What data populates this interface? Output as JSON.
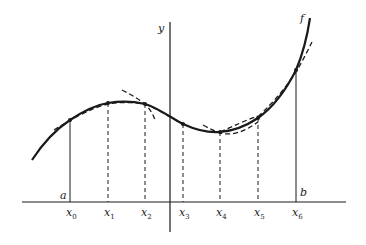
{
  "diagram": {
    "axis_labels": {
      "y": "y"
    },
    "curve_label": "f",
    "endpoint_labels": {
      "a": "a",
      "b": "b"
    },
    "nodes": [
      {
        "name": "x",
        "sub": "0",
        "px": 70,
        "py": 120,
        "line": "solid"
      },
      {
        "name": "x",
        "sub": "1",
        "px": 108,
        "py": 103,
        "line": "dashed"
      },
      {
        "name": "x",
        "sub": "2",
        "px": 145,
        "py": 104,
        "line": "dashed"
      },
      {
        "name": "x",
        "sub": "3",
        "px": 183,
        "py": 124,
        "line": "dashed"
      },
      {
        "name": "x",
        "sub": "4",
        "px": 220,
        "py": 132,
        "line": "dashed"
      },
      {
        "name": "x",
        "sub": "5",
        "px": 258,
        "py": 118,
        "line": "dashed"
      },
      {
        "name": "x",
        "sub": "6",
        "px": 296,
        "py": 70,
        "line": "solid"
      }
    ],
    "colors": {
      "ink": "#1a1a1a",
      "background": "#ffffff"
    }
  }
}
